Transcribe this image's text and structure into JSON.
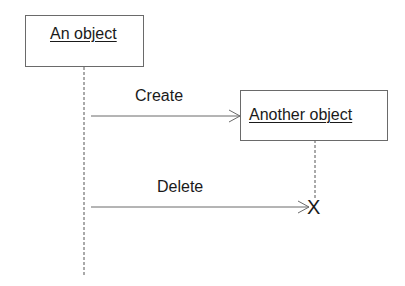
{
  "diagram_type": "UML sequence diagram",
  "objects": [
    {
      "name": "An object"
    },
    {
      "name": "Another object"
    }
  ],
  "messages": [
    {
      "label": "Create",
      "from": "An object",
      "to": "Another object",
      "kind": "create"
    },
    {
      "label": "Delete",
      "from": "An object",
      "to": "Another object",
      "kind": "destroy"
    }
  ],
  "destroy_marker": "X",
  "colors": {
    "line": "#6a6a6a",
    "text": "#1a1a1a",
    "background": "#ffffff"
  }
}
